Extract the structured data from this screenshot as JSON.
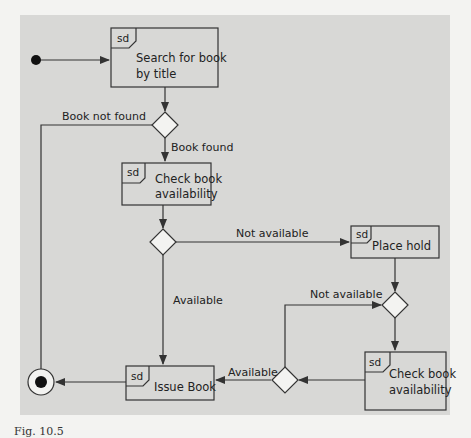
{
  "diagram": {
    "type": "interaction-overview",
    "colors": {
      "background": "#d8d8d6",
      "stroke": "#333333",
      "text": "#222222",
      "page": "#f3f3f1"
    },
    "frame_tag": "sd",
    "nodes": {
      "initial": {
        "kind": "initial-node"
      },
      "search": {
        "kind": "interaction",
        "tag": "sd",
        "line1": "Search for book",
        "line2": "by title"
      },
      "decision_found": {
        "kind": "decision"
      },
      "check1": {
        "kind": "interaction",
        "tag": "sd",
        "line1": "Check book",
        "line2": "availability"
      },
      "decision_avail1": {
        "kind": "decision"
      },
      "place_hold": {
        "kind": "interaction",
        "tag": "sd",
        "line1": "Place hold"
      },
      "merge_hold": {
        "kind": "merge"
      },
      "check2": {
        "kind": "interaction",
        "tag": "sd",
        "line1": "Check book",
        "line2": "availability"
      },
      "decision_avail2": {
        "kind": "decision"
      },
      "issue": {
        "kind": "interaction",
        "tag": "sd",
        "line1": "Issue Book"
      },
      "final": {
        "kind": "final-node"
      }
    },
    "edges": [
      {
        "from": "initial",
        "to": "search",
        "label": ""
      },
      {
        "from": "search",
        "to": "decision_found",
        "label": ""
      },
      {
        "from": "decision_found",
        "to": "final",
        "label": "Book not found"
      },
      {
        "from": "decision_found",
        "to": "check1",
        "label": "Book found"
      },
      {
        "from": "check1",
        "to": "decision_avail1",
        "label": ""
      },
      {
        "from": "decision_avail1",
        "to": "place_hold",
        "label": "Not available"
      },
      {
        "from": "decision_avail1",
        "to": "issue",
        "label": "Available"
      },
      {
        "from": "place_hold",
        "to": "merge_hold",
        "label": ""
      },
      {
        "from": "merge_hold",
        "to": "check2",
        "label": ""
      },
      {
        "from": "check2",
        "to": "decision_avail2",
        "label": ""
      },
      {
        "from": "decision_avail2",
        "to": "merge_hold",
        "label": "Not available"
      },
      {
        "from": "decision_avail2",
        "to": "issue",
        "label": "Available"
      },
      {
        "from": "issue",
        "to": "final",
        "label": ""
      }
    ],
    "labels": {
      "book_not_found": "Book not found",
      "book_found": "Book found",
      "not_available_1": "Not available",
      "available_1": "Available",
      "not_available_2": "Not available",
      "available_2": "Available"
    }
  },
  "caption": "Fig. 10.5"
}
